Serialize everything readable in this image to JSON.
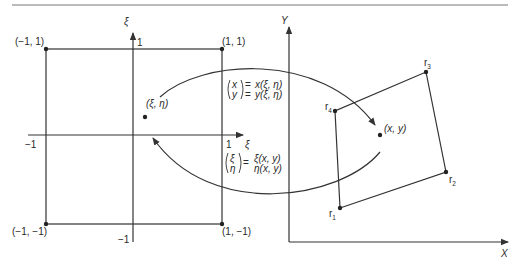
{
  "figure": {
    "colors": {
      "line": "#333333",
      "text": "#2a2a2a",
      "background": "#ffffff"
    }
  },
  "reference_domain": {
    "axis_vertical_label": "ξ",
    "axis_horizontal_label": "ξ",
    "tick_top": "1",
    "tick_bottom": "−1",
    "tick_left": "−1",
    "tick_right": "1",
    "corners": {
      "top_left": "(−1, 1)",
      "top_right": "(1, 1)",
      "bottom_left": "(−1, −1)",
      "bottom_right": "(1, −1)"
    },
    "point_label": "(ξ, η)"
  },
  "physical_domain": {
    "axis_vertical_label": "Y",
    "axis_horizontal_label": "X",
    "nodes": [
      {
        "label": "r",
        "sub": "1"
      },
      {
        "label": "r",
        "sub": "2"
      },
      {
        "label": "r",
        "sub": "3"
      },
      {
        "label": "r",
        "sub": "4"
      }
    ],
    "point_label": "(x, y)"
  },
  "forward_map": {
    "lhs_top": "x",
    "lhs_bottom": "y",
    "rhs_top": "x(ξ, η)",
    "rhs_bottom": "y(ξ, η)"
  },
  "inverse_map": {
    "lhs_top": "ξ",
    "lhs_bottom": "η",
    "rhs_top": "ξ(x, y)",
    "rhs_bottom": "η(x, y)"
  },
  "equals": "="
}
